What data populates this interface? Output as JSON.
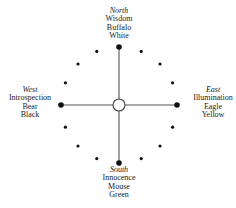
{
  "diagram": {
    "type": "medicine-wheel",
    "center": {
      "x": 119,
      "y": 105
    },
    "radius": 58,
    "center_circle_radius": 6,
    "small_dot_count_between_cardinals": 3,
    "colors": {
      "line": "#555555",
      "dot": "#111111",
      "center_fill": "#ffffff",
      "text": "#1a1a1a"
    },
    "directions": [
      {
        "key": "north",
        "name": "North",
        "quality": "Wisdom",
        "animal": "Buffalo",
        "color": "White"
      },
      {
        "key": "east",
        "name": "East",
        "quality": "Illumination",
        "animal": "Eagle",
        "color": "Yellow"
      },
      {
        "key": "south",
        "name": "South",
        "quality": "Innocence",
        "animal": "Mouse",
        "color": "Green"
      },
      {
        "key": "west",
        "name": "West",
        "quality": "Introspection",
        "animal": "Bear",
        "color": "Black"
      }
    ]
  }
}
